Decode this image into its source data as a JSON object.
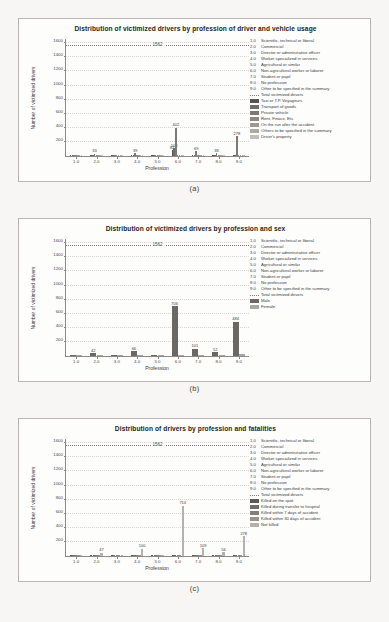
{
  "figure": {
    "background": "#f7f6f4",
    "panel_background": "#fdfdfc",
    "panels": [
      {
        "id": "a",
        "caption": "(a)"
      },
      {
        "id": "b",
        "caption": "(b)"
      },
      {
        "id": "c",
        "caption": "(c)"
      }
    ]
  },
  "profession_codes": [
    {
      "code": "1.0",
      "label": "Scientific, technical or liberal"
    },
    {
      "code": "2.0",
      "label": "Commercial"
    },
    {
      "code": "3.0",
      "label": "Director or administrative officer"
    },
    {
      "code": "4.0",
      "label": "Worker specialized in services"
    },
    {
      "code": "5.0",
      "label": "Agricultural or similar"
    },
    {
      "code": "6.0",
      "label": "Non-agricultural worker or laborer"
    },
    {
      "code": "7.0",
      "label": "Student or pupil"
    },
    {
      "code": "8.0",
      "label": "No profession"
    },
    {
      "code": "9.0",
      "label": "Other to be specified in the summary"
    }
  ],
  "chart_data": [
    {
      "panel": "a",
      "type": "bar",
      "title": "Distribution of victimized drivers by profession of driver and vehicle usage",
      "xlabel": "Profession",
      "ylabel": "Number of victimized drivers",
      "ylim": [
        0,
        1660
      ],
      "yticks": [
        200,
        400,
        600,
        800,
        1000,
        1200,
        1400,
        1600
      ],
      "xticks": [
        "1.0",
        "2.0",
        "3.0",
        "4.0",
        "5.0",
        "6.0",
        "7.0",
        "8.0",
        "9.0"
      ],
      "grid": true,
      "legend_position": "right",
      "reference_line": {
        "label": "1562",
        "value": 1562,
        "name": "Total victimized drivers"
      },
      "categories": [
        "1.0",
        "2.0",
        "3.0",
        "4.0",
        "5.0",
        "6.0",
        "7.0",
        "8.0",
        "9.0"
      ],
      "series": [
        {
          "name": "Taxi or T.P. Voyageurs",
          "color": "#585450",
          "values": [
            3,
            4,
            2,
            3,
            2,
            82,
            4,
            3,
            6
          ]
        },
        {
          "name": "Transport of goods",
          "color": "#6f6b66",
          "values": [
            4,
            6,
            3,
            5,
            3,
            108,
            6,
            5,
            12
          ]
        },
        {
          "name": "Private vehicle",
          "color": "#7d7974",
          "values": [
            7,
            33,
            6,
            39,
            5,
            402,
            69,
            38,
            278
          ]
        },
        {
          "name": "Rent, Finace, Ets",
          "color": "#8d8984",
          "values": [
            2,
            3,
            2,
            3,
            2,
            7,
            4,
            3,
            9
          ]
        },
        {
          "name": "On the run after the accident",
          "color": "#9d9994",
          "values": [
            2,
            2,
            1,
            2,
            1,
            5,
            3,
            2,
            7
          ]
        },
        {
          "name": "Others to be specified in the summary",
          "color": "#adaaa5",
          "values": [
            2,
            3,
            2,
            3,
            2,
            6,
            3,
            3,
            8
          ]
        },
        {
          "name": "Driver's property",
          "color": "#c2bfba",
          "values": [
            3,
            4,
            2,
            4,
            2,
            9,
            5,
            4,
            14
          ]
        }
      ],
      "annotated_values": [
        {
          "x": "2.0",
          "value": 33
        },
        {
          "x": "4.0",
          "value": 39
        },
        {
          "x": "6.0",
          "value": 82
        },
        {
          "x": "6.0",
          "value": 108
        },
        {
          "x": "6.0",
          "value": 402
        },
        {
          "x": "7.0",
          "value": 69
        },
        {
          "x": "8.0",
          "value": 38
        },
        {
          "x": "9.0",
          "value": 278
        }
      ]
    },
    {
      "panel": "b",
      "type": "bar",
      "title": "Distribution of victimized drivers by profession and sex",
      "xlabel": "Profession",
      "ylabel": "Number of victimized drivers",
      "ylim": [
        0,
        1660
      ],
      "yticks": [
        200,
        400,
        600,
        800,
        1000,
        1200,
        1400,
        1600
      ],
      "xticks": [
        "1.0",
        "2.0",
        "3.0",
        "4.0",
        "5.0",
        "6.0",
        "7.0",
        "8.0",
        "9.0"
      ],
      "grid": true,
      "legend_position": "right",
      "reference_line": {
        "label": "1562",
        "value": 1562,
        "name": "Total victimized drivers"
      },
      "categories": [
        "1.0",
        "2.0",
        "3.0",
        "4.0",
        "5.0",
        "6.0",
        "7.0",
        "8.0",
        "9.0"
      ],
      "series": [
        {
          "name": "Male",
          "color": "#6b6762",
          "values": [
            8,
            42,
            9,
            66,
            11,
            706,
            101,
            52,
            484
          ]
        },
        {
          "name": "Female",
          "color": "#a9a6a1",
          "values": [
            2,
            4,
            2,
            5,
            2,
            18,
            9,
            5,
            32
          ]
        }
      ],
      "annotated_values": [
        {
          "x": "2.0",
          "value": 42
        },
        {
          "x": "4.0",
          "value": 66
        },
        {
          "x": "6.0",
          "value": 706
        },
        {
          "x": "7.0",
          "value": 101
        },
        {
          "x": "8.0",
          "value": 52
        },
        {
          "x": "9.0",
          "value": 484
        }
      ]
    },
    {
      "panel": "c",
      "type": "bar",
      "title": "Distribution of drivers by profession and fatalities",
      "xlabel": "Profession",
      "ylabel": "Number of victimized drivers",
      "ylim": [
        0,
        1660
      ],
      "yticks": [
        200,
        400,
        600,
        800,
        1000,
        1200,
        1400,
        1600
      ],
      "xticks": [
        "1.0",
        "2.0",
        "3.0",
        "4.0",
        "5.0",
        "6.0",
        "7.0",
        "8.0",
        "9.0"
      ],
      "grid": true,
      "legend_position": "right",
      "reference_line": {
        "label": "1562",
        "value": 1562,
        "name": "Total victimized drivers"
      },
      "categories": [
        "1.0",
        "2.0",
        "3.0",
        "4.0",
        "5.0",
        "6.0",
        "7.0",
        "8.0",
        "9.0"
      ],
      "series": [
        {
          "name": "Killed on the spot",
          "color": "#5d5955",
          "values": [
            2,
            3,
            2,
            3,
            2,
            9,
            4,
            3,
            11
          ]
        },
        {
          "name": "Killed during transfer to hospital",
          "color": "#716d68",
          "values": [
            2,
            3,
            1,
            2,
            1,
            6,
            3,
            2,
            8
          ]
        },
        {
          "name": "Killed within 7 days of accident",
          "color": "#847f7a",
          "values": [
            2,
            2,
            1,
            2,
            1,
            5,
            3,
            2,
            7
          ]
        },
        {
          "name": "Killed within 30 days of accident",
          "color": "#98938e",
          "values": [
            2,
            2,
            1,
            2,
            1,
            4,
            2,
            2,
            6
          ]
        },
        {
          "name": "Not killed",
          "color": "#b5b2ad",
          "values": [
            9,
            47,
            9,
            100,
            12,
            714,
            109,
            56,
            278
          ]
        }
      ],
      "annotated_values": [
        {
          "x": "2.0",
          "value": 47
        },
        {
          "x": "4.0",
          "value": 100
        },
        {
          "x": "6.0",
          "value": 714
        },
        {
          "x": "7.0",
          "value": 109
        },
        {
          "x": "8.0",
          "value": 56
        },
        {
          "x": "9.0",
          "value": 278
        }
      ]
    }
  ],
  "legends": {
    "a": {
      "codes": [
        {
          "key": "1.0",
          "text": "Scientific, technical or liberal"
        },
        {
          "key": "2.0",
          "text": "Commercial"
        },
        {
          "key": "3.0",
          "text": "Director or administrative officer"
        },
        {
          "key": "4.0",
          "text": "Worker specialized in services"
        },
        {
          "key": "5.0",
          "text": "Agricultural or similar"
        },
        {
          "key": "6.0",
          "text": "Non-agricultural worker or laborer"
        },
        {
          "key": "7.0",
          "text": "Student or pupil"
        },
        {
          "key": "8.0",
          "text": "No profession"
        },
        {
          "key": "9.0",
          "text": "Other to be specified in the summary"
        }
      ],
      "line_entry": {
        "text": "Total victimized drivers"
      },
      "swatches": [
        {
          "text": "Taxi or T.P. Voyageurs",
          "color": "#585450"
        },
        {
          "text": "Transport of goods",
          "color": "#6f6b66"
        },
        {
          "text": "Private vehicle",
          "color": "#7d7974"
        },
        {
          "text": "Rent, Finace, Ets",
          "color": "#8d8984"
        },
        {
          "text": "On the run after the accident",
          "color": "#9d9994"
        },
        {
          "text": "Others to be specified in the summary",
          "color": "#adaaa5"
        },
        {
          "text": "Driver's property",
          "color": "#c2bfba"
        }
      ]
    },
    "b": {
      "codes": [
        {
          "key": "1.0",
          "text": "Scientific, technical or liberal"
        },
        {
          "key": "2.0",
          "text": "Commercial"
        },
        {
          "key": "3.0",
          "text": "Director or administrative officer"
        },
        {
          "key": "4.0",
          "text": "Worker specialized in services"
        },
        {
          "key": "5.0",
          "text": "Agricultural or similar"
        },
        {
          "key": "6.0",
          "text": "Non-agricultural worker or laborer"
        },
        {
          "key": "7.0",
          "text": "Student or pupil"
        },
        {
          "key": "8.0",
          "text": "No profession"
        },
        {
          "key": "9.0",
          "text": "Other to be specified in the summary"
        }
      ],
      "line_entry": {
        "text": "Total victimized drivers"
      },
      "swatches": [
        {
          "text": "Male",
          "color": "#6b6762"
        },
        {
          "text": "Female",
          "color": "#a9a6a1"
        }
      ]
    },
    "c": {
      "codes": [
        {
          "key": "1.0",
          "text": "Scientific, technical or liberal"
        },
        {
          "key": "2.0",
          "text": "Commercial"
        },
        {
          "key": "3.0",
          "text": "Director or administrative officer"
        },
        {
          "key": "4.0",
          "text": "Worker specialized in services"
        },
        {
          "key": "5.0",
          "text": "Agricultural or similar"
        },
        {
          "key": "6.0",
          "text": "Non-agricultural worker or laborer"
        },
        {
          "key": "7.0",
          "text": "Student or pupil"
        },
        {
          "key": "8.0",
          "text": "No profession"
        },
        {
          "key": "9.0",
          "text": "Other to be specified in the summary"
        }
      ],
      "line_entry": {
        "text": "Total victimized drivers"
      },
      "swatches": [
        {
          "text": "Killed on the spot",
          "color": "#5d5955"
        },
        {
          "text": "Killed during transfer to hospital",
          "color": "#716d68"
        },
        {
          "text": "Killed within 7 days of accident",
          "color": "#847f7a"
        },
        {
          "text": "Killed within 30 days of accident",
          "color": "#98938e"
        },
        {
          "text": "Not killed",
          "color": "#b5b2ad"
        }
      ]
    }
  }
}
